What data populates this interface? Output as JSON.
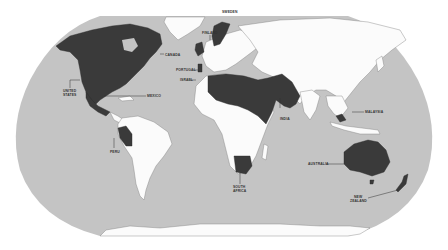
{
  "map": {
    "title": "World map highlighting selected countries",
    "projection": "Robinson-like",
    "colors": {
      "ocean": "#c4c4c4",
      "land": "#fbfbfb",
      "highlighted": "#3a3a3a",
      "border": "#7a7a7a",
      "background": "#ffffff"
    },
    "labels": [
      {
        "id": "canada",
        "text": "CANADA"
      },
      {
        "id": "sweden",
        "text": "SWEDEN"
      },
      {
        "id": "finland",
        "text": "FINLAND"
      },
      {
        "id": "portugal",
        "text": "PORTUGAL"
      },
      {
        "id": "israel",
        "text": "ISRAEL"
      },
      {
        "id": "united-states-1",
        "text": "UNITED"
      },
      {
        "id": "united-states-2",
        "text": "STATES"
      },
      {
        "id": "mexico",
        "text": "MEXICO"
      },
      {
        "id": "peru",
        "text": "PERU"
      },
      {
        "id": "india",
        "text": "INDIA"
      },
      {
        "id": "malaysia",
        "text": "MALAYSIA"
      },
      {
        "id": "australia",
        "text": "AUSTRALIA"
      },
      {
        "id": "south-africa-1",
        "text": "SOUTH"
      },
      {
        "id": "south-africa-2",
        "text": "AFRICA"
      },
      {
        "id": "new-zealand-1",
        "text": "NEW"
      },
      {
        "id": "new-zealand-2",
        "text": "ZEALAND"
      }
    ]
  }
}
